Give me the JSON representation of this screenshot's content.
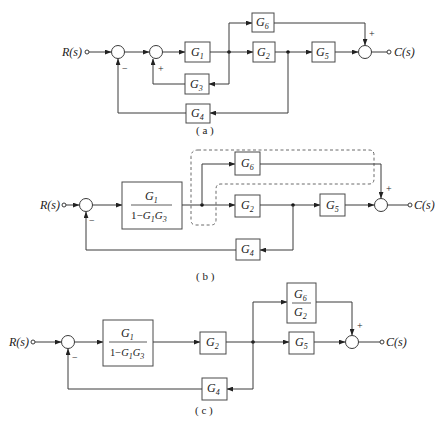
{
  "figure": {
    "diagrams": [
      {
        "id": "a",
        "caption": "( a )",
        "input_label": "R(s)",
        "output_label": "C(s)",
        "blocks": [
          {
            "name": "G",
            "sub": "1"
          },
          {
            "name": "G",
            "sub": "2"
          },
          {
            "name": "G",
            "sub": "3"
          },
          {
            "name": "G",
            "sub": "4"
          },
          {
            "name": "G",
            "sub": "5"
          },
          {
            "name": "G",
            "sub": "6"
          }
        ],
        "signs": {
          "sum1_feedback": "−",
          "sum2_feedback": "+",
          "sum3_top": "+"
        }
      },
      {
        "id": "b",
        "caption": "( b )",
        "input_label": "R(s)",
        "output_label": "C(s)",
        "fraction_block": {
          "numerator": "G",
          "numerator_sub": "1",
          "denominator": "1−G",
          "den_sub1": "1",
          "den_mid": "G",
          "den_sub2": "3"
        },
        "blocks": [
          {
            "name": "G",
            "sub": "2"
          },
          {
            "name": "G",
            "sub": "4"
          },
          {
            "name": "G",
            "sub": "5"
          },
          {
            "name": "G",
            "sub": "6"
          }
        ],
        "signs": {
          "sum1_feedback": "−",
          "sum2_top": "+"
        }
      },
      {
        "id": "c",
        "caption": "( c )",
        "input_label": "R(s)",
        "output_label": "C(s)",
        "fraction_block": {
          "numerator": "G",
          "numerator_sub": "1",
          "denominator": "1−G",
          "den_sub1": "1",
          "den_mid": "G",
          "den_sub2": "3"
        },
        "ratio_block": {
          "numerator": "G",
          "numerator_sub": "6",
          "denominator": "G",
          "denominator_sub": "2"
        },
        "blocks": [
          {
            "name": "G",
            "sub": "2"
          },
          {
            "name": "G",
            "sub": "4"
          },
          {
            "name": "G",
            "sub": "5"
          }
        ],
        "signs": {
          "sum1_feedback": "−",
          "sum2_top": "+"
        }
      }
    ]
  }
}
